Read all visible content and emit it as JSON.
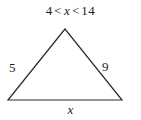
{
  "figure": {
    "type": "geometry-triangle-diagram",
    "background_color": "#ffffff",
    "stroke_color": "#2b2b2b",
    "text_color": "#222222",
    "canvas": {
      "width": 141,
      "height": 120
    },
    "inequality": {
      "full_text": "4 < x < 14",
      "lower_bound": "4",
      "first_relation": "<",
      "variable": "x",
      "second_relation": "<",
      "upper_bound": "14"
    },
    "triangle": {
      "vertices": {
        "apex": {
          "x": 65,
          "y": 29
        },
        "bottom_left": {
          "x": 8,
          "y": 100
        },
        "bottom_right": {
          "x": 122,
          "y": 100
        }
      },
      "points_attr": "65,29 8,100 122,100",
      "stroke_width": "1.2"
    },
    "side_labels": {
      "left": "5",
      "right": "9",
      "base": "x"
    }
  }
}
